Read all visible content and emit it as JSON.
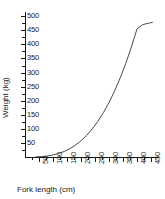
{
  "chart_data": {
    "type": "line",
    "title": "",
    "xlabel": "Fork length (cm)",
    "ylabel": "Weight (kg)",
    "xlim": [
      0,
      475
    ],
    "ylim": [
      0,
      515
    ],
    "grid": false,
    "legend": "none",
    "x_ticks": [
      50,
      100,
      150,
      200,
      250,
      300,
      350,
      400,
      450
    ],
    "x_tick_labels": [
      "50",
      "100",
      "150",
      "200",
      "250",
      "300",
      "350",
      "400",
      "450"
    ],
    "y_ticks": [
      50,
      100,
      150,
      200,
      250,
      300,
      350,
      400,
      450,
      500
    ],
    "y_tick_labels": [
      "50",
      "100",
      "150",
      "200",
      "250",
      "300",
      "350",
      "400",
      "450",
      "500"
    ],
    "series": [
      {
        "name": "length-weight relationship",
        "style": "solid-line",
        "color": "#2b2b2b",
        "x": [
          40,
          60,
          80,
          100,
          120,
          140,
          160,
          180,
          200,
          220,
          240,
          260,
          280,
          300,
          320,
          340,
          360,
          380,
          400,
          420,
          440,
          455
        ],
        "y": [
          0.5,
          1.6,
          3.7,
          7.2,
          12.4,
          19.7,
          29.4,
          42.0,
          57.6,
          76.7,
          99.5,
          126.3,
          157.6,
          193.5,
          234.5,
          280.8,
          332.7,
          390.5,
          454.6,
          470.0,
          475.0,
          478.0
        ]
      }
    ]
  },
  "axes": {
    "y_axis_title": "Weight (kg)",
    "x_axis_title": "Fork length (cm)"
  }
}
